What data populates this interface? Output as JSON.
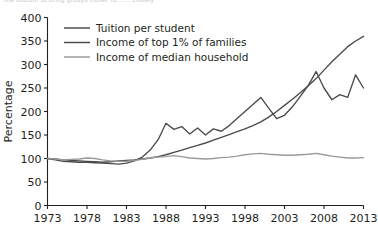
{
  "top_artifact": {
    "text": "the bottom to bring groups closer to ...... closely"
  },
  "chart_data": {
    "type": "line",
    "title": "",
    "xlabel": "",
    "ylabel": "Percentage",
    "xlim": [
      1973,
      2013
    ],
    "ylim": [
      0,
      400
    ],
    "grid": false,
    "legend_position": "top-left",
    "xticks": [
      "1973",
      "1978",
      "1983",
      "1988",
      "1993",
      "1998",
      "2003",
      "2008",
      "2013"
    ],
    "yticks": [
      "0",
      "50",
      "100",
      "150",
      "200",
      "250",
      "300",
      "350",
      "400"
    ],
    "x": [
      1973,
      1974,
      1975,
      1976,
      1977,
      1978,
      1979,
      1980,
      1981,
      1982,
      1983,
      1984,
      1985,
      1986,
      1987,
      1988,
      1989,
      1990,
      1991,
      1992,
      1993,
      1994,
      1995,
      1996,
      1997,
      1998,
      1999,
      2000,
      2001,
      2002,
      2003,
      2004,
      2005,
      2006,
      2007,
      2008,
      2009,
      2010,
      2011,
      2012,
      2013
    ],
    "series": [
      {
        "name": "Tuition per student",
        "color": "#4a4a4a",
        "values": [
          100,
          99,
          97,
          96,
          95,
          94,
          93,
          92,
          93,
          95,
          96,
          97,
          99,
          101,
          104,
          108,
          113,
          118,
          123,
          128,
          133,
          139,
          145,
          151,
          157,
          163,
          170,
          178,
          188,
          200,
          213,
          226,
          240,
          255,
          270,
          288,
          306,
          322,
          338,
          350,
          360
        ]
      },
      {
        "name": "Income of top 1% of families",
        "color": "#4a4a4a",
        "values": [
          100,
          97,
          94,
          93,
          92,
          92,
          91,
          90,
          89,
          88,
          90,
          95,
          103,
          118,
          140,
          175,
          162,
          168,
          152,
          165,
          150,
          163,
          158,
          170,
          185,
          200,
          215,
          230,
          207,
          185,
          192,
          210,
          232,
          255,
          285,
          250,
          225,
          236,
          230,
          278,
          250
        ]
      },
      {
        "name": "Income of median household",
        "color": "#9a9a9a",
        "values": [
          100,
          99,
          97,
          98,
          99,
          101,
          100,
          97,
          95,
          94,
          94,
          96,
          98,
          101,
          103,
          104,
          106,
          104,
          101,
          100,
          99,
          100,
          102,
          103,
          105,
          108,
          110,
          111,
          109,
          108,
          107,
          107,
          108,
          109,
          111,
          108,
          105,
          103,
          101,
          101,
          102
        ]
      }
    ]
  },
  "legend": {
    "items": [
      {
        "label": "Tuition per student",
        "color": "#4a4a4a"
      },
      {
        "label": "Income of top 1% of families",
        "color": "#4a4a4a"
      },
      {
        "label": "Income of median household",
        "color": "#9a9a9a"
      }
    ]
  }
}
